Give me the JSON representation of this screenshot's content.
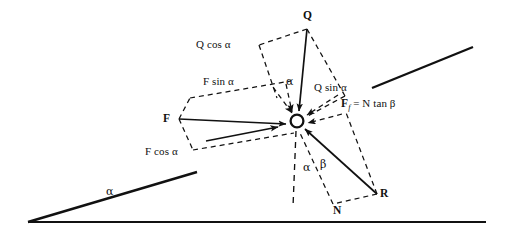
{
  "figure": {
    "type": "force-diagram",
    "background_color": "#ffffff",
    "line_color": "#111111"
  },
  "labels": {
    "applied_force_Q": "Q",
    "applied_force_F": "F",
    "reaction_R": "R",
    "normal_N": "N",
    "q_cos_alpha": "Q cos α",
    "q_sin_alpha": "Q sin α",
    "f_sin_alpha": "F sin α",
    "f_cos_alpha": "F cos α",
    "friction_prefix": "F",
    "friction_subscript": "f",
    "friction_suffix": " = N tan β",
    "angle_alpha_incline": "α",
    "angle_alpha_q": "α",
    "angle_alpha_node": "α",
    "angle_beta_node": "β"
  },
  "geometry": {
    "node": {
      "cx": 297,
      "cy": 121,
      "r": 6.5
    },
    "ground_line": {
      "x1": 28,
      "y1": 222,
      "x2": 486,
      "y2": 222
    },
    "incline_left": {
      "x1": 28,
      "y1": 222,
      "x2": 196,
      "y2": 173
    },
    "incline_right": {
      "x1": 372,
      "y1": 88,
      "x2": 473,
      "y2": 47
    },
    "vector_Q": {
      "x1": 307,
      "y1": 27,
      "x2": 298,
      "y2": 113
    },
    "vector_F": {
      "x1": 178,
      "y1": 119,
      "x2": 288,
      "y2": 124
    },
    "vector_R": {
      "x1": 377,
      "y1": 194,
      "x2": 303,
      "y2": 128
    }
  }
}
